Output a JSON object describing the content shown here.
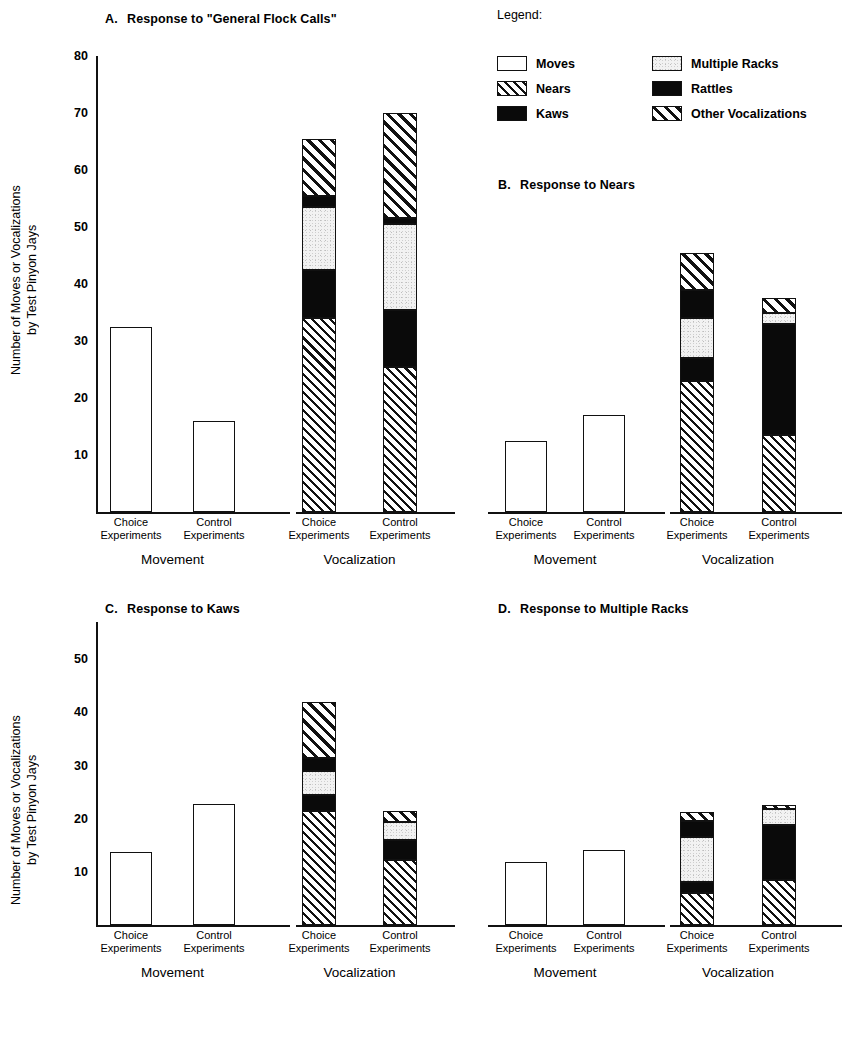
{
  "figure": {
    "y_axis_label_line1": "Number of Moves or Vocalizations",
    "y_axis_label_line2": "by Test Pinyon Jays"
  },
  "legend": {
    "title": "Legend:",
    "items": [
      {
        "label": "Moves",
        "pattern": "white-empty"
      },
      {
        "label": "Nears",
        "pattern": "fine-diagonal-hatch"
      },
      {
        "label": "Kaws",
        "pattern": "solid-black"
      },
      {
        "label": "Multiple Racks",
        "pattern": "light-stipple"
      },
      {
        "label": "Rattles",
        "pattern": "solid-black"
      },
      {
        "label": "Other Vocalizations",
        "pattern": "coarse-diagonal-hatch"
      }
    ]
  },
  "axis_labels": {
    "choice": "Choice\nExperiments",
    "choice_line1": "Choice",
    "choice_line2": "Experiments",
    "control_line1": "Control",
    "control_line2": "Experiments",
    "group_movement": "Movement",
    "group_vocalization": "Vocalization"
  },
  "chart_data": [
    {
      "id": "A",
      "type": "bar",
      "title": "A.   Response to \"General Flock Calls\"",
      "title_letter": "A.",
      "title_text": "Response to \"General Flock Calls\"",
      "ylabel": "Number of Moves or Vocalizations by Test Pinyon Jays",
      "ylim": [
        0,
        80
      ],
      "yticks": [
        10,
        20,
        30,
        40,
        50,
        60,
        70,
        80
      ],
      "grid": false,
      "groups": [
        "Movement",
        "Vocalization"
      ],
      "categories": [
        "Choice Experiments",
        "Control Experiments"
      ],
      "series": [
        {
          "name": "Moves",
          "values": [
            32.5,
            16.0,
            0,
            0
          ]
        },
        {
          "name": "Nears",
          "values": [
            0,
            0,
            34.0,
            25.5
          ]
        },
        {
          "name": "Kaws",
          "values": [
            0,
            0,
            8.5,
            10.0
          ]
        },
        {
          "name": "Multiple Racks",
          "values": [
            0,
            0,
            11.0,
            15.0
          ]
        },
        {
          "name": "Rattles",
          "values": [
            0,
            0,
            2.0,
            1.0
          ]
        },
        {
          "name": "Other Vocalizations",
          "values": [
            0,
            0,
            10.0,
            18.5
          ]
        }
      ],
      "totals": [
        32.5,
        16.0,
        65.5,
        70.0
      ]
    },
    {
      "id": "B",
      "type": "bar",
      "title": "B.   Response to Nears",
      "title_letter": "B.",
      "title_text": "Response to Nears",
      "ylim": [
        0,
        80
      ],
      "yticks": [],
      "grid": false,
      "groups": [
        "Movement",
        "Vocalization"
      ],
      "categories": [
        "Choice Experiments",
        "Control Experiments"
      ],
      "series": [
        {
          "name": "Moves",
          "values": [
            12.5,
            17.0,
            0,
            0
          ]
        },
        {
          "name": "Nears",
          "values": [
            0,
            0,
            23.0,
            13.5
          ]
        },
        {
          "name": "Kaws",
          "values": [
            0,
            0,
            4.0,
            19.5
          ]
        },
        {
          "name": "Multiple Racks",
          "values": [
            0,
            0,
            7.0,
            2.0
          ]
        },
        {
          "name": "Rattles",
          "values": [
            0,
            0,
            5.0,
            0
          ]
        },
        {
          "name": "Other Vocalizations",
          "values": [
            0,
            0,
            6.5,
            2.5
          ]
        }
      ],
      "totals": [
        12.5,
        17.0,
        45.5,
        37.5
      ]
    },
    {
      "id": "C",
      "type": "bar",
      "title": "C.   Response to Kaws",
      "title_letter": "C.",
      "title_text": "Response to Kaws",
      "ylabel": "Number of Moves or Vocalizations by Test Pinyon Jays",
      "ylim": [
        0,
        57
      ],
      "yticks": [
        10,
        20,
        30,
        40,
        50
      ],
      "grid": false,
      "groups": [
        "Movement",
        "Vocalization"
      ],
      "categories": [
        "Choice Experiments",
        "Control Experiments"
      ],
      "series": [
        {
          "name": "Moves",
          "values": [
            13.8,
            22.8,
            0,
            0
          ]
        },
        {
          "name": "Nears",
          "values": [
            0,
            0,
            21.5,
            12.2
          ]
        },
        {
          "name": "Kaws",
          "values": [
            0,
            0,
            3.0,
            3.8
          ]
        },
        {
          "name": "Multiple Racks",
          "values": [
            0,
            0,
            4.5,
            3.3
          ]
        },
        {
          "name": "Rattles",
          "values": [
            0,
            0,
            2.5,
            0
          ]
        },
        {
          "name": "Other Vocalizations",
          "values": [
            0,
            0,
            10.5,
            2.2
          ]
        }
      ],
      "totals": [
        13.8,
        22.8,
        42.0,
        21.5
      ]
    },
    {
      "id": "D",
      "type": "bar",
      "title": "D.   Response to Multiple Racks",
      "title_letter": "D.",
      "title_text": "Response to Multiple Racks",
      "ylim": [
        0,
        57
      ],
      "yticks": [],
      "grid": false,
      "groups": [
        "Movement",
        "Vocalization"
      ],
      "categories": [
        "Choice Experiments",
        "Control Experiments"
      ],
      "series": [
        {
          "name": "Moves",
          "values": [
            11.8,
            14.2,
            0,
            0
          ]
        },
        {
          "name": "Nears",
          "values": [
            0,
            0,
            6.0,
            8.5
          ]
        },
        {
          "name": "Kaws",
          "values": [
            0,
            0,
            2.0,
            10.3
          ]
        },
        {
          "name": "Multiple Racks",
          "values": [
            0,
            0,
            8.5,
            3.0
          ]
        },
        {
          "name": "Rattles",
          "values": [
            0,
            0,
            3.0,
            0
          ]
        },
        {
          "name": "Other Vocalizations",
          "values": [
            0,
            0,
            1.8,
            0.8
          ]
        }
      ],
      "totals": [
        11.8,
        14.2,
        21.3,
        22.6
      ]
    }
  ]
}
